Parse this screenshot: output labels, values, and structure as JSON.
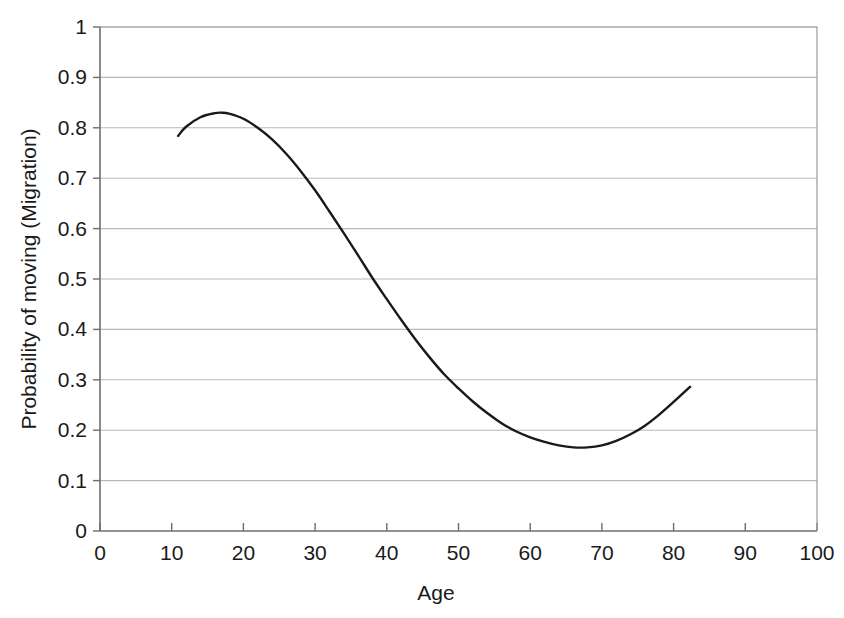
{
  "chart_data": {
    "type": "line",
    "title": "",
    "xlabel": "Age",
    "ylabel": "Probability of moving (Migration)",
    "xlim": [
      0,
      100
    ],
    "ylim": [
      0,
      1
    ],
    "xticks": [
      0,
      10,
      20,
      30,
      40,
      50,
      60,
      70,
      80,
      90,
      100
    ],
    "yticks": [
      0,
      0.1,
      0.2,
      0.3,
      0.4,
      0.5,
      0.6,
      0.7,
      0.8,
      0.9,
      1
    ],
    "xtick_labels": [
      "0",
      "10",
      "20",
      "30",
      "40",
      "50",
      "60",
      "70",
      "80",
      "90",
      "100"
    ],
    "ytick_labels": [
      "0",
      "0.1",
      "0.2",
      "0.3",
      "0.4",
      "0.5",
      "0.6",
      "0.7",
      "0.8",
      "0.9",
      "1"
    ],
    "grid": "horizontal",
    "grid_color": "#b9b9b9",
    "legend": "none",
    "line_color": "#1a1a1a",
    "line_width": 2.4,
    "series": [
      {
        "name": "Probability of moving (Migration)",
        "x": [
          10.9,
          12,
          14,
          16,
          17,
          18,
          20,
          22,
          24,
          26,
          28,
          30,
          32,
          34,
          36,
          38,
          40,
          42,
          44,
          46,
          48,
          50,
          52,
          54,
          56,
          58,
          60,
          62,
          64,
          66,
          68,
          70,
          72,
          74,
          76,
          78,
          80,
          82.3
        ],
        "y": [
          0.784,
          0.802,
          0.821,
          0.829,
          0.83,
          0.828,
          0.818,
          0.8,
          0.777,
          0.748,
          0.714,
          0.676,
          0.634,
          0.591,
          0.547,
          0.502,
          0.46,
          0.419,
          0.38,
          0.344,
          0.311,
          0.283,
          0.257,
          0.234,
          0.214,
          0.198,
          0.186,
          0.177,
          0.17,
          0.166,
          0.166,
          0.17,
          0.179,
          0.192,
          0.209,
          0.231,
          0.256,
          0.286
        ]
      }
    ],
    "annotations": {
      "peak": {
        "x": 17,
        "y": 0.83
      },
      "minimum": {
        "x": 66.5,
        "y": 0.166
      },
      "start": {
        "x": 10.9,
        "y": 0.784
      },
      "end": {
        "x": 82.3,
        "y": 0.286
      }
    }
  },
  "axes": {
    "x_axis_name": "age-axis",
    "y_axis_name": "probability-axis"
  }
}
